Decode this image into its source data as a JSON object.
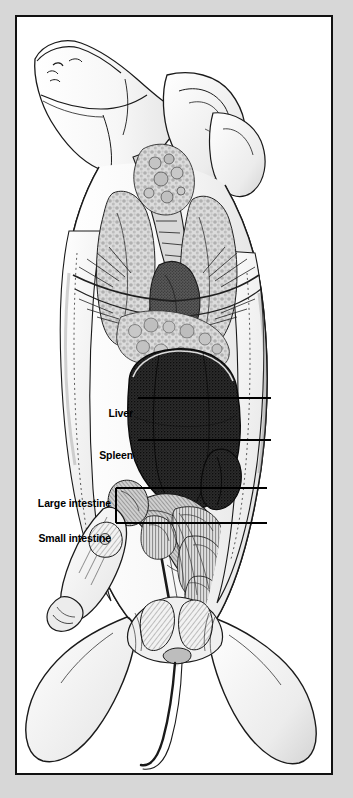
{
  "figure": {
    "view": "dorsal dissection showing abdominal and thoracic viscera",
    "frame_color": "#111111",
    "page_background": "#d7d7d7",
    "plate_background": "#ffffff",
    "ink_color": "#111111"
  },
  "callouts": [
    {
      "id": "liver",
      "label": "Liver",
      "text_x": 129,
      "text_y": 396,
      "line_x1": 135,
      "line_y1": 396,
      "line_x2": 268,
      "line_y2": 396
    },
    {
      "id": "spleen",
      "label": "Spleen",
      "text_x": 129,
      "text_y": 438,
      "line_x1": 135,
      "line_y1": 438,
      "line_x2": 268,
      "line_y2": 438
    },
    {
      "id": "large-intestine",
      "label": "Large intestine",
      "text_x": 129,
      "text_y": 486,
      "line_x1": 135,
      "line_y1": 486,
      "line_x2": 264,
      "line_y2": 486
    },
    {
      "id": "small-intestine",
      "label": "Small intestine",
      "text_x": 129,
      "text_y": 521,
      "line_x1": 135,
      "line_y1": 521,
      "line_x2": 264,
      "line_y2": 521
    }
  ],
  "bracket": {
    "vertical_x": 113,
    "top_y": 486,
    "bottom_y": 521,
    "stub_x": 135
  },
  "organs": [
    {
      "name": "liver",
      "tone": "very-dark stipple",
      "region": "upper-mid abdomen"
    },
    {
      "name": "spleen",
      "tone": "dark stipple",
      "region": "left of liver, lower"
    },
    {
      "name": "large intestine",
      "tone": "mid gray coils",
      "region": "mid abdomen"
    },
    {
      "name": "small intestine",
      "tone": "light gray coils",
      "region": "mid-lower abdomen"
    },
    {
      "name": "lungs",
      "tone": "mottled light gray",
      "region": "thorax"
    },
    {
      "name": "trachea",
      "tone": "banded light",
      "region": "neck"
    },
    {
      "name": "ribs",
      "tone": "hatched",
      "region": "thoracic wall"
    }
  ]
}
